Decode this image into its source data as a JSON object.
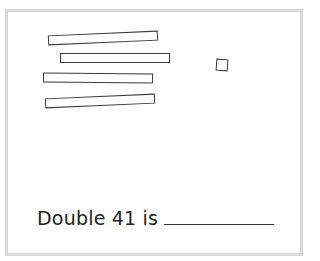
{
  "worksheet": {
    "question": {
      "prefix": "Double 41 is",
      "answer": ""
    },
    "manipulatives": {
      "tens_rods": 4,
      "ones_cubes": 1
    },
    "colors": {
      "border": "#d9d9d9",
      "stroke": "#3a3a3a",
      "text": "#222222"
    }
  }
}
